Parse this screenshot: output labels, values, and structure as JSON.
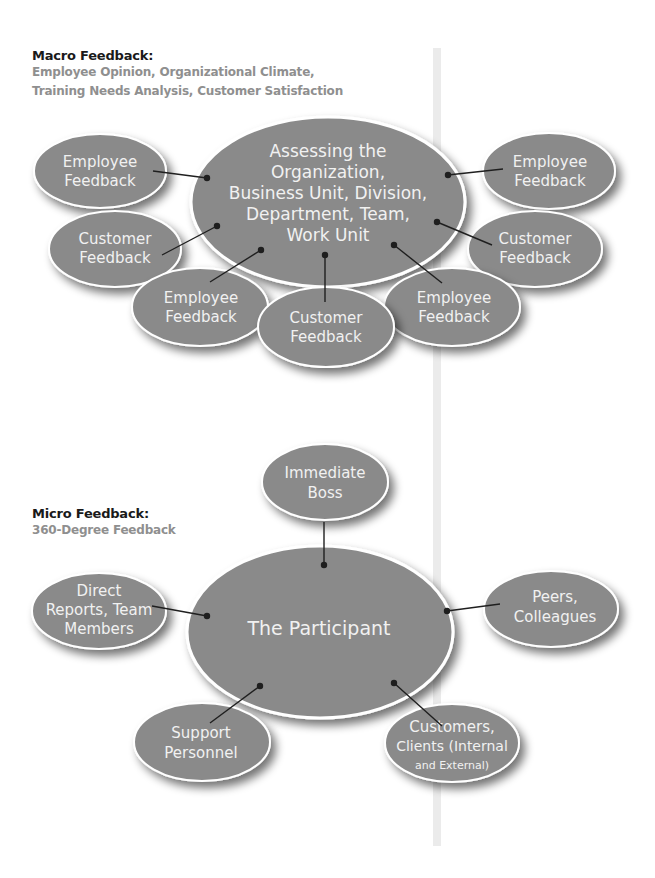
{
  "macro": {
    "title": "Macro Feedback:",
    "subtitle_line1": "Employee Opinion, Organizational Climate,",
    "subtitle_line2": "Training Needs Analysis, Customer Satisfaction",
    "center": {
      "lines": [
        "Assessing the",
        "Organization,",
        "Business Unit, Division,",
        "Department, Team,",
        "Work Unit"
      ]
    },
    "nodes": [
      {
        "id": "left-top",
        "lines": [
          "Employee",
          "Feedback"
        ]
      },
      {
        "id": "left-mid",
        "lines": [
          "Customer",
          "Feedback"
        ]
      },
      {
        "id": "bottom-left",
        "lines": [
          "Employee",
          "Feedback"
        ]
      },
      {
        "id": "bottom-center",
        "lines": [
          "Customer",
          "Feedback"
        ]
      },
      {
        "id": "bottom-right",
        "lines": [
          "Employee",
          "Feedback"
        ]
      },
      {
        "id": "right-top",
        "lines": [
          "Employee",
          "Feedback"
        ]
      },
      {
        "id": "right-mid",
        "lines": [
          "Customer",
          "Feedback"
        ]
      }
    ]
  },
  "micro": {
    "title": "Micro Feedback:",
    "subtitle": "360-Degree Feedback",
    "center": {
      "lines": [
        "The Participant"
      ]
    },
    "nodes": [
      {
        "id": "top",
        "lines": [
          "Immediate",
          "Boss"
        ]
      },
      {
        "id": "left",
        "lines": [
          "Direct",
          "Reports, Team",
          "Members"
        ]
      },
      {
        "id": "right",
        "lines": [
          "Peers,",
          "Colleagues"
        ]
      },
      {
        "id": "bottom-left",
        "lines": [
          "Support",
          "Personnel"
        ]
      },
      {
        "id": "bottom-right",
        "lines": [
          "Customers,",
          "Clients (Internal",
          "and External)"
        ]
      }
    ]
  },
  "colors": {
    "ellipse_fill": "#8a8a8a",
    "ellipse_stroke": "#ffffff",
    "connector": "#1f1f1f",
    "heading": "#1a1a1a",
    "subheading": "#8f8f8f",
    "divider_bar": "#ebebeb"
  }
}
